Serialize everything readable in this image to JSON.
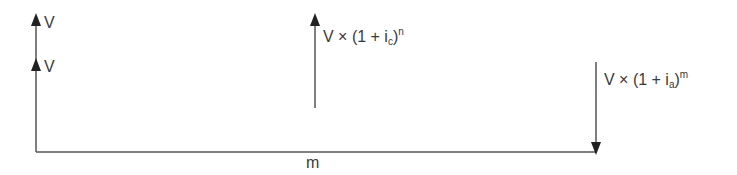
{
  "diagram": {
    "type": "cash-flow timeline",
    "colors": {
      "line": "#444444",
      "text": "#3a3a3a",
      "background": "#ffffff"
    },
    "left_arrows": [
      {
        "label": "V",
        "direction": "up"
      },
      {
        "label": "V",
        "direction": "up"
      }
    ],
    "middle_arrow": {
      "direction": "up",
      "label_main": "V × (1 + i",
      "label_sub": "c",
      "label_close": ")",
      "label_sup": "n"
    },
    "right_arrow": {
      "direction": "down",
      "label_main": "V × (1 + i",
      "label_sub": "a",
      "label_close": ")",
      "label_sup": "m"
    },
    "axis_label": "m"
  }
}
